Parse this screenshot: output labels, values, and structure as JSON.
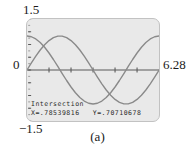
{
  "figure": {
    "caption": "(a)",
    "screen_bg": "#e9e9e9",
    "curve_color": "#8a8a8a",
    "axis_color": "#5a5a5a"
  },
  "axis_labels": {
    "y_max": "1.5",
    "y_min": "−1.5",
    "y_zero": "0",
    "x_max": "6.28"
  },
  "readout": {
    "title": "Intersection",
    "x_label": "X=",
    "x_value": ".78539816",
    "y_label": "Y=",
    "y_value": ".70710678",
    "line": "X=.78539816   Y=.70710678"
  },
  "chart_data": {
    "type": "line",
    "title": "",
    "subtitle": "",
    "xlabel": "",
    "ylabel": "",
    "xlim": [
      0,
      6.28
    ],
    "ylim": [
      -1.5,
      1.5
    ],
    "grid": false,
    "legend_position": "none",
    "x_ticks": [
      1.0472,
      2.0944,
      3.1416,
      4.1888,
      5.236
    ],
    "x_tick_labels": [
      "",
      "",
      "",
      "",
      ""
    ],
    "y_ticks": [
      -1.5,
      -1.125,
      -0.75,
      -0.375,
      0,
      0.375,
      0.75,
      1.125,
      1.5
    ],
    "y_tick_labels": [
      "−1.5",
      "",
      "",
      "",
      "0",
      "",
      "",
      "",
      "1.5"
    ],
    "series": [
      {
        "name": "cos(x)",
        "x": [
          0,
          0.2094,
          0.4189,
          0.6283,
          0.8378,
          1.0472,
          1.2566,
          1.4661,
          1.6755,
          1.885,
          2.0944,
          2.3038,
          2.5133,
          2.7227,
          2.9322,
          3.1416,
          3.351,
          3.5605,
          3.7699,
          3.9794,
          4.1888,
          4.3982,
          4.6077,
          4.8171,
          5.0265,
          5.236,
          5.4454,
          5.6549,
          5.8643,
          6.0737,
          6.2832
        ],
        "values": [
          1,
          0.9781,
          0.9135,
          0.809,
          0.6691,
          0.5,
          0.309,
          0.1045,
          -0.1045,
          -0.309,
          -0.5,
          -0.6691,
          -0.809,
          -0.9135,
          -0.9781,
          -1,
          -0.9781,
          -0.9135,
          -0.809,
          -0.6691,
          -0.5,
          -0.309,
          -0.1045,
          0.1045,
          0.309,
          0.5,
          0.6691,
          0.809,
          0.9135,
          0.9781,
          1
        ]
      },
      {
        "name": "sin(x)",
        "x": [
          0,
          0.2094,
          0.4189,
          0.6283,
          0.8378,
          1.0472,
          1.2566,
          1.4661,
          1.6755,
          1.885,
          2.0944,
          2.3038,
          2.5133,
          2.7227,
          2.9322,
          3.1416,
          3.351,
          3.5605,
          3.7699,
          3.9794,
          4.1888,
          4.3982,
          4.6077,
          4.8171,
          5.0265,
          5.236,
          5.4454,
          5.6549,
          5.8643,
          6.0737,
          6.2832
        ],
        "values": [
          0,
          0.2079,
          0.4067,
          0.5878,
          0.7431,
          0.866,
          0.9511,
          0.9945,
          0.9945,
          0.9511,
          0.866,
          0.7431,
          0.5878,
          0.4067,
          0.2079,
          0,
          -0.2079,
          -0.4067,
          -0.5878,
          -0.7431,
          -0.866,
          -0.9511,
          -0.9945,
          -0.9945,
          -0.9511,
          -0.866,
          -0.7431,
          -0.5878,
          -0.4067,
          -0.2079,
          0
        ]
      }
    ],
    "annotations": [
      {
        "label": "Intersection",
        "x": 0.78539816,
        "y": 0.70710678
      }
    ]
  }
}
